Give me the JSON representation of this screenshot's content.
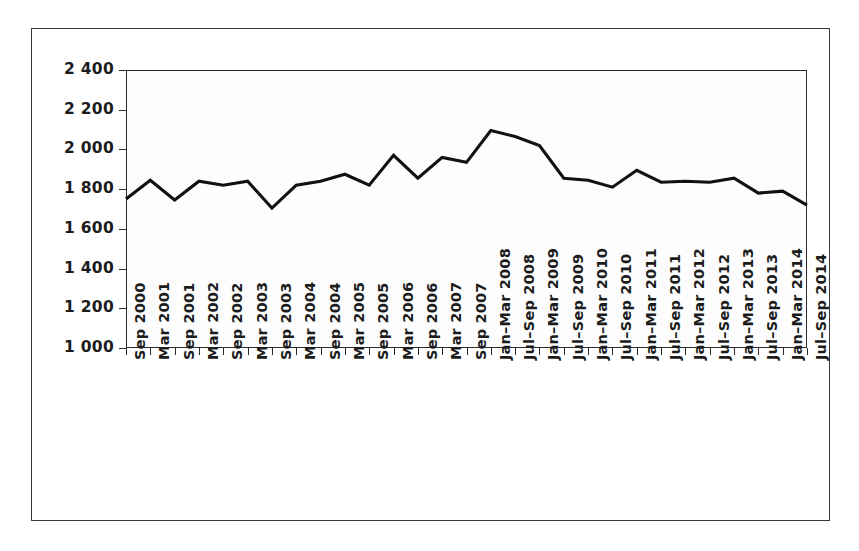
{
  "chart_data": {
    "type": "line",
    "title": "",
    "subtitle": "",
    "xlabel": "",
    "ylabel": "",
    "ylim": [
      1000,
      2400
    ],
    "ytick_step": 200,
    "ytick_labels": [
      "2 400",
      "2 200",
      "2 000",
      "1 800",
      "1 600",
      "1 400",
      "1 200",
      "1 000"
    ],
    "ytick_values": [
      2400,
      2200,
      2000,
      1800,
      1600,
      1400,
      1200,
      1000
    ],
    "grid": true,
    "legend": false,
    "legend_position": "none",
    "line_color": "#111111",
    "categories": [
      "Sep 2000",
      "Mar 2001",
      "Sep 2001",
      "Mar 2002",
      "Sep 2002",
      "Mar 2003",
      "Sep 2003",
      "Mar 2004",
      "Sep 2004",
      "Mar 2005",
      "Sep 2005",
      "Mar 2006",
      "Sep 2006",
      "Mar 2007",
      "Sep 2007",
      "Jan–Mar 2008",
      "Jul–Sep 2008",
      "Jan–Mar 2009",
      "Jul–Sep 2009",
      "Jan–Mar 2010",
      "Jul–Sep 2010",
      "Jan–Mar 2011",
      "Jul–Sep 2011",
      "Jan–Mar 2012",
      "Jul–Sep 2012",
      "Jan–Mar 2013",
      "Jul–Sep 2013",
      "Jan–Mar 2014",
      "Jul–Sep 2014"
    ],
    "values": [
      1750,
      1845,
      1745,
      1840,
      1820,
      1840,
      1705,
      1820,
      1840,
      1875,
      1820,
      1970,
      1855,
      1960,
      1935,
      2095,
      2065,
      2020,
      1855,
      1845,
      1810,
      1895,
      1835,
      1840,
      1835,
      1855,
      1780,
      1790,
      1720
    ]
  }
}
